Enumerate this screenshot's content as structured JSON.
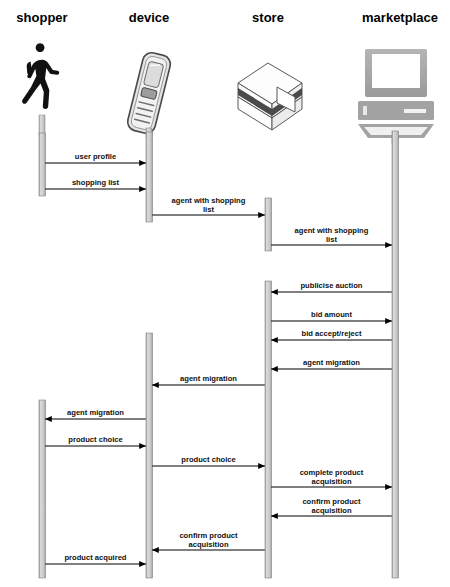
{
  "diagram": {
    "type": "uml-sequence-diagram",
    "width": 450,
    "height": 587,
    "background": "#ffffff",
    "lifeline_color": "#c9c9c9",
    "lifeline_border": "#808080",
    "arrow_color": "#000000",
    "lifelines": [
      {
        "id": "shopper",
        "label": "shopper",
        "x": 42,
        "icon": "walking-person-icon"
      },
      {
        "id": "device",
        "label": "device",
        "x": 149,
        "icon": "mobile-phone-icon"
      },
      {
        "id": "store",
        "label": "store",
        "x": 268,
        "icon": "server-box-icon"
      },
      {
        "id": "marketplace",
        "label": "marketplace",
        "x": 395,
        "icon": "desktop-computer-icon"
      }
    ],
    "activations": [
      {
        "lifeline": "shopper",
        "top": 133,
        "bottom": 196
      },
      {
        "lifeline": "shopper",
        "top": 400,
        "bottom": 578
      },
      {
        "lifeline": "device",
        "top": 132,
        "bottom": 222
      },
      {
        "lifeline": "device",
        "top": 333,
        "bottom": 578
      },
      {
        "lifeline": "store",
        "top": 198,
        "bottom": 251
      },
      {
        "lifeline": "store",
        "top": 281,
        "bottom": 578
      },
      {
        "lifeline": "marketplace",
        "top": 131,
        "bottom": 578
      }
    ],
    "messages": [
      {
        "label": "user profile",
        "from": "shopper",
        "to": "device",
        "y": 163,
        "lines": 1
      },
      {
        "label": "shopping list",
        "from": "shopper",
        "to": "device",
        "y": 189,
        "lines": 1
      },
      {
        "label": "agent with shopping\nlist",
        "from": "device",
        "to": "store",
        "y": 215,
        "lines": 2
      },
      {
        "label": "agent with shopping\nlist",
        "from": "store",
        "to": "marketplace",
        "y": 245,
        "lines": 2
      },
      {
        "label": "publicise auction",
        "from": "marketplace",
        "to": "store",
        "y": 292,
        "lines": 1
      },
      {
        "label": "bid amount",
        "from": "store",
        "to": "marketplace",
        "y": 321,
        "lines": 1
      },
      {
        "label": "bid accept/reject",
        "from": "marketplace",
        "to": "store",
        "y": 340,
        "lines": 1
      },
      {
        "label": "agent migration",
        "from": "marketplace",
        "to": "store",
        "y": 369,
        "lines": 1
      },
      {
        "label": "agent migration",
        "from": "store",
        "to": "device",
        "y": 385,
        "lines": 1
      },
      {
        "label": "agent migration",
        "from": "device",
        "to": "shopper",
        "y": 419,
        "lines": 1
      },
      {
        "label": "product choice",
        "from": "shopper",
        "to": "device",
        "y": 446,
        "lines": 1
      },
      {
        "label": "product choice",
        "from": "device",
        "to": "store",
        "y": 466,
        "lines": 1
      },
      {
        "label": "complete product\nacquisition",
        "from": "store",
        "to": "marketplace",
        "y": 487,
        "lines": 2
      },
      {
        "label": "confirm product\nacquisition",
        "from": "marketplace",
        "to": "store",
        "y": 516,
        "lines": 2
      },
      {
        "label": "confirm product\nacquisition",
        "from": "store",
        "to": "device",
        "y": 550,
        "lines": 2
      },
      {
        "label": "product acquired",
        "from": "shopper",
        "to": "device",
        "y": 564,
        "lines": 1
      }
    ],
    "title_y": 18
  }
}
